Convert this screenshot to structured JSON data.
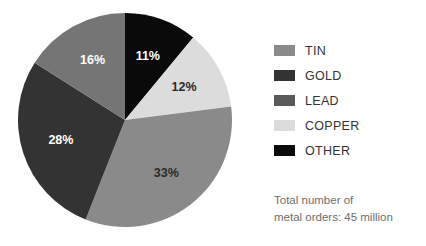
{
  "chart_data": {
    "type": "pie",
    "title": "",
    "categories": [
      "TIN",
      "GOLD",
      "LEAD",
      "COPPER",
      "OTHER"
    ],
    "values": [
      33,
      28,
      16,
      12,
      11
    ],
    "value_suffix": "%",
    "legend_position": "right",
    "grid": false,
    "slice_order_clockwise_from_top": [
      "OTHER",
      "COPPER",
      "TIN",
      "GOLD",
      "LEAD"
    ],
    "slices": [
      {
        "label": "OTHER",
        "value": 11,
        "display": "11%",
        "color": "#0a0a0a",
        "label_color": "#ffffff"
      },
      {
        "label": "COPPER",
        "value": 12,
        "display": "12%",
        "color": "#dcdcdc",
        "label_color": "#2b2b2b"
      },
      {
        "label": "TIN",
        "value": 33,
        "display": "33%",
        "color": "#8a8a8a",
        "label_color": "#2b2b2b"
      },
      {
        "label": "GOLD",
        "value": 28,
        "display": "28%",
        "color": "#333333",
        "label_color": "#ffffff"
      },
      {
        "label": "LEAD",
        "value": 16,
        "display": "16%",
        "color": "#757575",
        "label_color": "#ffffff"
      }
    ],
    "geometry": {
      "cx": 125,
      "cy": 120,
      "r": 107,
      "start_angle_deg": 0,
      "direction": "clockwise"
    },
    "annotations": [
      "Total number of metal orders: 45 million"
    ]
  },
  "legend": {
    "items": [
      {
        "label": "TIN",
        "color": "#8a8a8a"
      },
      {
        "label": "GOLD",
        "color": "#333333"
      },
      {
        "label": "LEAD",
        "color": "#595959"
      },
      {
        "label": "COPPER",
        "color": "#dcdcdc"
      },
      {
        "label": "OTHER",
        "color": "#0a0a0a"
      }
    ]
  },
  "footer": {
    "line1": "Total number of",
    "line2": "metal orders: 45 million"
  }
}
